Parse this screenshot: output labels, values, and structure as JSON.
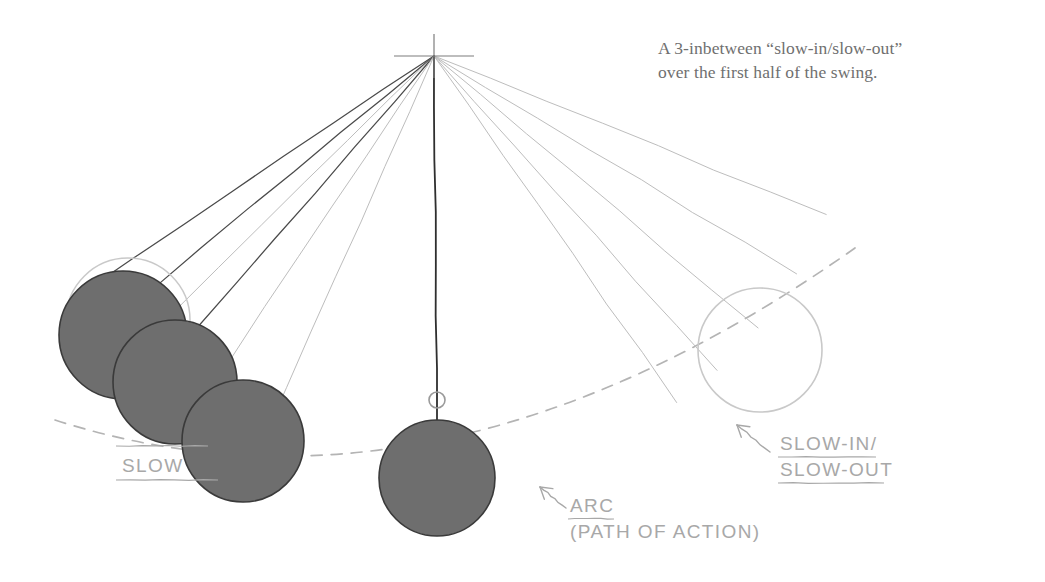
{
  "figure": {
    "type": "hand-drawn animation principle diagram",
    "background_color": "#ffffff",
    "ball_fill_color": "#6e6e6e",
    "ball_outline_color": "#3a3a3a",
    "ghost_outline_color": "#c9c9c9",
    "arc_color": "#b4b4b4",
    "fan_line_dark_color": "#4a4a4a",
    "fan_line_light_color": "#bdbdbd",
    "annotation_color": "#a8a8a8"
  },
  "caption": {
    "text": "A 3-inbetween “slow-in/slow-out”\nover the first half of the swing.",
    "line1": "A 3-inbetween “slow-in/slow-out”",
    "line2": "over the first half of the swing.",
    "color": "#6f6f6f"
  },
  "annotations": [
    {
      "id": "arc-label",
      "line1": "ARC",
      "line2": "(PATH OF ACTION)",
      "full_text": "ARC (PATH OF ACTION)",
      "underlined_word": "ARC",
      "x": 570,
      "y": 512,
      "arrow_from": [
        566,
        508
      ],
      "arrow_to": [
        540,
        487
      ]
    },
    {
      "id": "slow-in-slow-out-label",
      "line1": "SLOW-IN/",
      "line2": "SLOW-OUT",
      "full_text": "SLOW-IN / SLOW-OUT",
      "x": 780,
      "y": 450,
      "arrow_from": [
        770,
        452
      ],
      "arrow_to": [
        737,
        425
      ]
    },
    {
      "id": "slow-label-occluded",
      "line1": "SLOW",
      "full_text": "SLOW",
      "x": 122,
      "y": 472,
      "note": "partially hidden behind balls"
    }
  ],
  "pivot": {
    "x": 434,
    "y": 56,
    "crosshair_half_width": 40,
    "crosshair_half_height": 22
  },
  "chart_data": {
    "type": "scatter",
    "pivot": [
      434,
      56
    ],
    "radius": 423,
    "ball_radius": 58,
    "balls": [
      {
        "label": "extreme-left",
        "cx": 123,
        "cy": 335,
        "r": 64,
        "style": "filled",
        "order": 1
      },
      {
        "label": "inbetween-1",
        "cx": 175,
        "cy": 382,
        "r": 62,
        "style": "filled",
        "order": 2
      },
      {
        "label": "inbetween-2",
        "cx": 243,
        "cy": 441,
        "r": 61,
        "style": "filled",
        "order": 3
      },
      {
        "label": "bottom-center",
        "cx": 437,
        "cy": 478,
        "r": 58,
        "style": "filled",
        "order": 4
      },
      {
        "label": "extreme-right-ghost",
        "cx": 760,
        "cy": 350,
        "r": 62,
        "style": "outline",
        "order": 5
      }
    ],
    "ghost_balls": [
      {
        "label": "ghost-extreme-left",
        "cx": 128,
        "cy": 320,
        "r": 62,
        "style": "outline"
      }
    ],
    "fan_lines_left": [
      {
        "angle_deg": 214.0,
        "weight": "dark"
      },
      {
        "angle_deg": 219.5,
        "weight": "dark"
      },
      {
        "angle_deg": 224.5,
        "weight": "light"
      },
      {
        "angle_deg": 229.0,
        "weight": "dark"
      },
      {
        "angle_deg": 236.0,
        "weight": "light"
      },
      {
        "angle_deg": 246.0,
        "weight": "light"
      }
    ],
    "fan_lines_right": [
      {
        "angle_deg": 305.0,
        "weight": "light"
      },
      {
        "angle_deg": 312.0,
        "weight": "light"
      },
      {
        "angle_deg": 320.0,
        "weight": "light"
      },
      {
        "angle_deg": 329.0,
        "weight": "light"
      },
      {
        "angle_deg": 338.0,
        "weight": "light"
      }
    ],
    "vertical_string": {
      "from": [
        434,
        56
      ],
      "to": [
        437,
        420
      ],
      "marker": {
        "cx": 437,
        "cy": 400,
        "r": 8
      }
    },
    "arc": {
      "style": "dashed",
      "from": [
        55,
        420
      ],
      "to": [
        855,
        248
      ],
      "lowest_point": [
        437,
        485
      ]
    },
    "xlabel": "",
    "ylabel": "",
    "grid": false,
    "legend": "none"
  }
}
